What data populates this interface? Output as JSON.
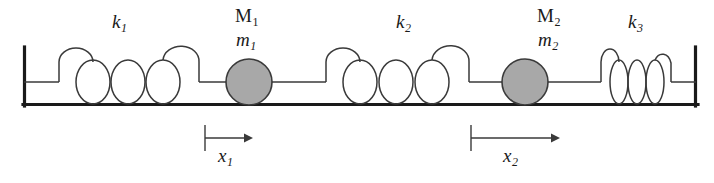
{
  "figure": {
    "type": "mechanical-schematic",
    "line_color": "#1a1a1a",
    "mass_fill_color": "#a8a8a8",
    "background_color": "#ffffff"
  },
  "springs": [
    {
      "id": "k1",
      "label": "k",
      "subscript": "1",
      "label_x": 112,
      "label_y": 12,
      "x_start": 58,
      "x_end": 200,
      "coils": 4,
      "compression": "relaxed"
    },
    {
      "id": "k2",
      "label": "k",
      "subscript": "2",
      "label_x": 396,
      "label_y": 12,
      "x_start": 325,
      "x_end": 470,
      "coils": 4,
      "compression": "relaxed"
    },
    {
      "id": "k3",
      "label": "k",
      "subscript": "3",
      "label_x": 628,
      "label_y": 12,
      "x_start": 600,
      "x_end": 672,
      "coils": 4,
      "compression": "compressed"
    }
  ],
  "masses": [
    {
      "id": "m1",
      "upper_label": "M",
      "upper_subscript": "1",
      "lower_label": "m",
      "lower_subscript": "1",
      "upper_label_x": 235,
      "upper_label_y": 6,
      "lower_label_x": 235,
      "lower_label_y": 30,
      "center_x": 249,
      "center_y": 82,
      "radius": 23
    },
    {
      "id": "m2",
      "upper_label": "M",
      "upper_subscript": "2",
      "lower_label": "m",
      "lower_subscript": "2",
      "upper_label_x": 537,
      "upper_label_y": 6,
      "lower_label_x": 537,
      "lower_label_y": 30,
      "center_x": 525,
      "center_y": 82,
      "radius": 23
    }
  ],
  "displacements": [
    {
      "id": "x1",
      "label": "x",
      "subscript": "1",
      "tick_x": 205,
      "arrow_x_end": 248,
      "label_x": 218,
      "label_y": 155
    },
    {
      "id": "x2",
      "label": "x",
      "subscript": "2",
      "tick_x": 471,
      "arrow_x_end": 555,
      "label_x": 503,
      "label_y": 155
    }
  ],
  "frame": {
    "baseline_y": 105,
    "left_wall_x": 23,
    "right_wall_x": 697,
    "wall_top_y": 47,
    "rod_y": 82
  }
}
